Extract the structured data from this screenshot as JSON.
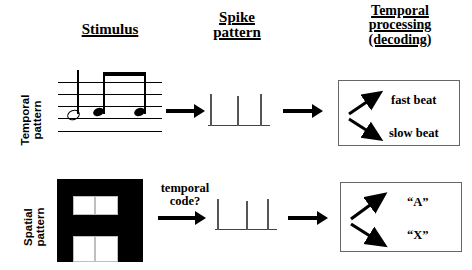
{
  "headings": {
    "stimulus": [
      "Stimulus"
    ],
    "spike": [
      "Spike",
      "pattern"
    ],
    "temporal": [
      "Temporal",
      "processing",
      "(decoding)"
    ]
  },
  "row_labels": {
    "temporal_pattern": "Temporal\npattern",
    "temporal_pattern_line1": "Temporal",
    "temporal_pattern_line2": "pattern",
    "spatial_pattern_line1": "Spatial",
    "spatial_pattern_line2": "pattern"
  },
  "captions": {
    "temporal_code_line1": "temporal",
    "temporal_code_line2": "code?"
  },
  "decoding": {
    "top": {
      "outputs": [
        "fast beat",
        "slow beat"
      ]
    },
    "bottom": {
      "outputs": [
        "“A”",
        "“X”"
      ]
    }
  },
  "stimulus_top": {
    "notation_type": "music-staff",
    "staff_lines": 5,
    "notes": [
      {
        "type": "half-note",
        "filled": false
      },
      {
        "type": "eighth-note",
        "filled": true,
        "beamed": true
      },
      {
        "type": "eighth-note",
        "filled": true,
        "beamed": true
      }
    ]
  },
  "stimulus_bottom": {
    "pattern_type": "letter-block",
    "background_color": "#000000",
    "cell_color": "#ffffff",
    "cells": 4
  },
  "spike_trains": {
    "top": {
      "count": 3
    },
    "bottom": {
      "count": 3
    }
  },
  "colors": {
    "foreground": "#000000",
    "background": "#ffffff",
    "box_border": "#666666",
    "spike": "#555555"
  }
}
